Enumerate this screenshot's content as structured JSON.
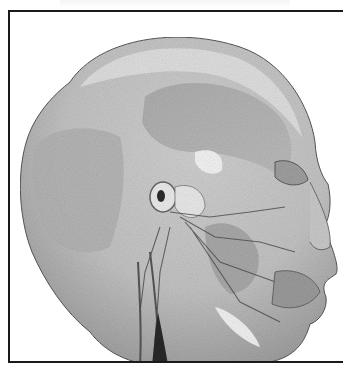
{
  "image": {
    "subject": "lateral view of dissected human head showing facial muscles, nerves and vessels",
    "palette": {
      "background": "#ffffff",
      "frame": "#1a1a1a",
      "skin_light": "#e4e4e4",
      "skin_mid": "#bdbdbd",
      "muscle_dark": "#8f8f8f",
      "deep_shadow": "#3a3a3a"
    }
  }
}
